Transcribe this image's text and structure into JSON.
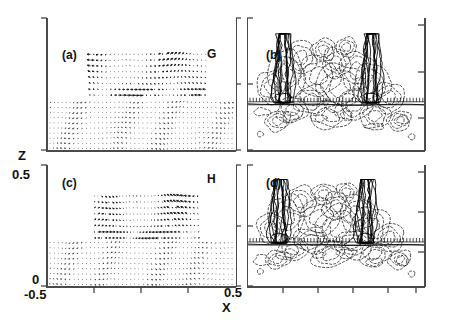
{
  "figure": {
    "axis_labels": {
      "x": "X",
      "z": "Z"
    },
    "x_ticks": [
      {
        "value": "-0.5",
        "pos": 0.0
      },
      {
        "value": "0.5",
        "pos": 1.0
      }
    ],
    "z_ticks": [
      {
        "value": "0",
        "pos": 0.0
      },
      {
        "value": "0.5",
        "pos": 1.0
      }
    ],
    "panels": [
      {
        "id": "a",
        "tag": "(a)",
        "case": "G",
        "type": "vector",
        "row": 0,
        "col": 0
      },
      {
        "id": "b",
        "tag": "(b)",
        "case": "G",
        "type": "contour",
        "row": 0,
        "col": 1
      },
      {
        "id": "c",
        "tag": "(c)",
        "case": "H",
        "type": "vector",
        "row": 1,
        "col": 0
      },
      {
        "id": "d",
        "tag": "(d)",
        "case": "H",
        "type": "contour",
        "row": 1,
        "col": 1
      }
    ],
    "case_labels": [
      {
        "label": "G",
        "row": 0
      },
      {
        "label": "H",
        "row": 1
      }
    ]
  },
  "chart_data": {
    "type": "scatter",
    "title": "",
    "xlabel": "X",
    "ylabel": "Z",
    "xlim": [
      -0.5,
      0.5
    ],
    "ylim": [
      0,
      0.5
    ],
    "grid": false,
    "legend": "none",
    "panels": [
      {
        "id": "a",
        "tag": "(a)",
        "case": "G",
        "kind": "vector-field",
        "description": "Velocity vector field; dense fine arrows below z~0.19 (substrate layer), coarser larger arrows in a rectangular patch spanning x from about -0.27 to 0.34, z from 0.20 to 0.37",
        "patch": {
          "x0": -0.27,
          "x1": 0.34,
          "z0": 0.2,
          "z1": 0.37
        },
        "substrate_top": 0.19,
        "grid_nx": 46,
        "grid_nz": 22
      },
      {
        "id": "b",
        "tag": "(b)",
        "case": "G",
        "kind": "contour",
        "description": "Contour plot; dashed negative contours fill the interior, dense solid positive contour bundles (plumes) rise near x=-0.30 and x=+0.20, hatched band along z~0.19",
        "plume_x": [
          -0.3,
          0.2
        ],
        "band_z": 0.19,
        "negative_linestyle": "dashed",
        "positive_linestyle": "solid"
      },
      {
        "id": "c",
        "tag": "(c)",
        "case": "H",
        "kind": "vector-field",
        "description": "Velocity vector field; dense fine arrows below z~0.19, coarser arrows in patch x from about -0.25 to 0.30, z from 0.19 to 0.38, with visible shear striations",
        "patch": {
          "x0": -0.25,
          "x1": 0.3,
          "z0": 0.19,
          "z1": 0.38
        },
        "substrate_top": 0.19,
        "grid_nx": 46,
        "grid_nz": 22
      },
      {
        "id": "d",
        "tag": "(d)",
        "case": "H",
        "kind": "contour",
        "description": "Contour plot; dashed negative contours dominate, two tall solid positive plumes near x=-0.32 and x=+0.17, hatched band along z~0.19",
        "plume_x": [
          -0.32,
          0.17
        ],
        "band_z": 0.19,
        "negative_linestyle": "dashed",
        "positive_linestyle": "solid"
      }
    ]
  }
}
